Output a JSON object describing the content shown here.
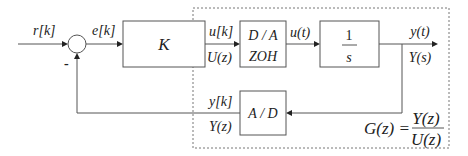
{
  "signals": {
    "reference": "r[k]",
    "error": "e[k]",
    "control_discrete": "u[k]",
    "control_z": "U(z)",
    "control_continuous": "u(t)",
    "output_continuous": "y(t)",
    "output_s": "Y(s)",
    "output_discrete": "y[k]",
    "output_z": "Y(z)",
    "feedback_sign": "-"
  },
  "blocks": {
    "controller": "K",
    "dac_line1": "D / A",
    "dac_line2": "ZOH",
    "plant_num": "1",
    "plant_den": "s",
    "adc": "A / D"
  },
  "transfer_function": {
    "lhs": "G(z) =",
    "numerator": "Y(z)",
    "denominator": "U(z)"
  }
}
